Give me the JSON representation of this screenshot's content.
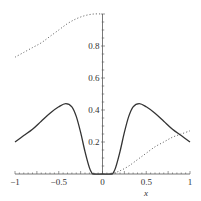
{
  "chart_data": {
    "type": "line",
    "title": "",
    "xlabel": "x",
    "ylabel": "",
    "xlim": [
      -1,
      1
    ],
    "ylim": [
      0,
      1
    ],
    "grid": false,
    "legend": null,
    "x_ticks": [
      -1,
      -0.5,
      0,
      0.5,
      1
    ],
    "x_tick_labels": [
      "−1",
      "−0.5",
      "0",
      "0.5",
      "1"
    ],
    "y_ticks": [
      0.2,
      0.4,
      0.6,
      0.8,
      1
    ],
    "y_tick_labels": [
      "0.2",
      "0.4",
      "0.6",
      "0.8",
      ""
    ],
    "series": [
      {
        "name": "solid curve",
        "style": "solid",
        "color": "#333333",
        "x": [
          -1,
          -0.9,
          -0.8,
          -0.7,
          -0.6,
          -0.5,
          -0.42,
          -0.35,
          -0.3,
          -0.25,
          -0.2,
          -0.15,
          -0.12,
          -0.1,
          0,
          0.1,
          0.12,
          0.15,
          0.2,
          0.25,
          0.3,
          0.35,
          0.42,
          0.5,
          0.6,
          0.7,
          0.8,
          0.9,
          1
        ],
        "y": [
          0.2,
          0.24,
          0.28,
          0.33,
          0.38,
          0.42,
          0.44,
          0.42,
          0.36,
          0.26,
          0.14,
          0.04,
          0.005,
          0,
          0,
          0,
          0.005,
          0.04,
          0.14,
          0.26,
          0.36,
          0.42,
          0.44,
          0.42,
          0.38,
          0.33,
          0.28,
          0.24,
          0.2
        ]
      },
      {
        "name": "dotted curve (left)",
        "style": "dotted",
        "color": "#555555",
        "x": [
          -1,
          -0.9,
          -0.8,
          -0.7,
          -0.6,
          -0.5,
          -0.4,
          -0.3,
          -0.2,
          -0.1,
          0
        ],
        "y": [
          0.73,
          0.76,
          0.79,
          0.82,
          0.86,
          0.9,
          0.94,
          0.97,
          0.99,
          1.0,
          1.0
        ]
      },
      {
        "name": "dotted curve (right)",
        "style": "dotted",
        "color": "#555555",
        "x": [
          0.1,
          0.2,
          0.3,
          0.4,
          0.5,
          0.6,
          0.7,
          0.8,
          0.9,
          1
        ],
        "y": [
          0,
          0.02,
          0.05,
          0.09,
          0.13,
          0.17,
          0.2,
          0.23,
          0.25,
          0.27
        ]
      }
    ]
  }
}
